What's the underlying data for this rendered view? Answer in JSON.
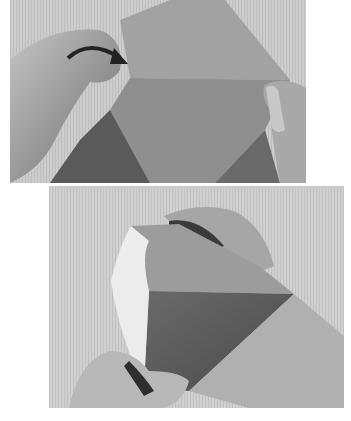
{
  "figure": {
    "type": "origami instructional photographs",
    "style": "grayscale",
    "photos": [
      {
        "id": "top",
        "description": "Hands holding a square sheet; a curved arrow indicates folding the left flap over to the right",
        "annotation": "curved-arrow-right"
      },
      {
        "id": "bottom",
        "description": "Hands curling the paper into a cone shape, white reverse side visible on the left edge"
      }
    ],
    "colors": {
      "background": "#ffffff",
      "backdrop": "#c8c8c8",
      "paper": "#8a8a8a",
      "paper_dark": "#5e5e5e",
      "paper_white_side": "#ececec",
      "skin": "#b4b4b4",
      "skin_shadow": "#7a7a7a",
      "arrow": "#222222"
    }
  }
}
